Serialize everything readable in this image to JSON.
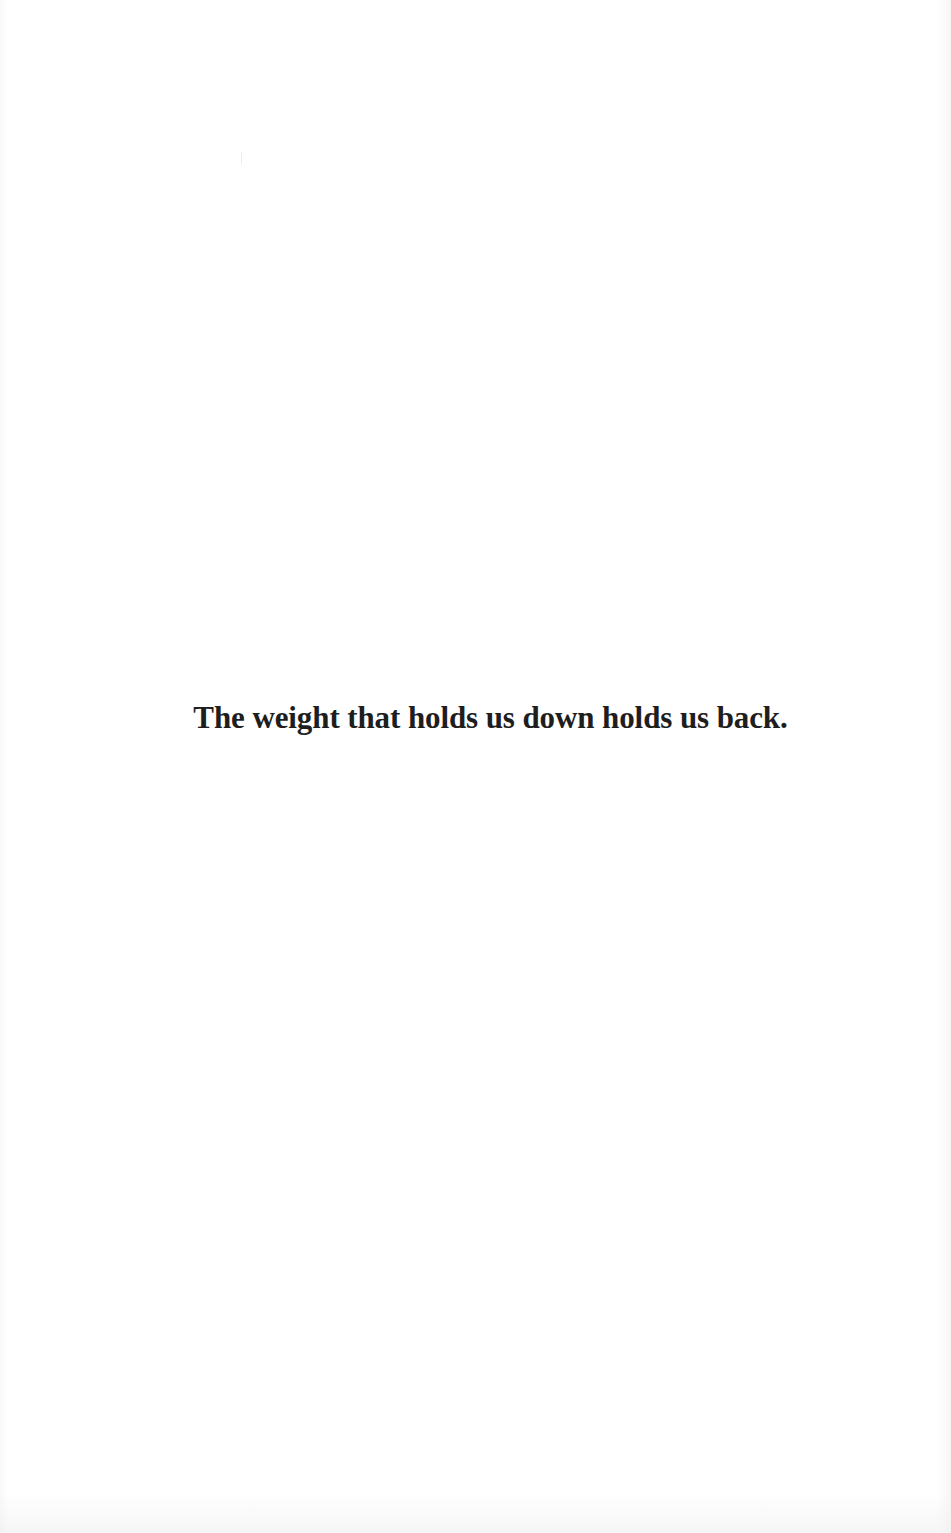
{
  "page": {
    "epigraph": "The weight that holds us down holds us back.",
    "background_color": "#ffffff",
    "text_color": "#1e1e1e"
  }
}
